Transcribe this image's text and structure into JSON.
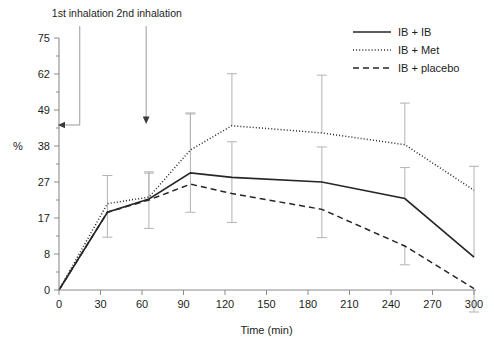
{
  "chart_data": {
    "type": "line",
    "title": "",
    "xlabel": "Time (min)",
    "ylabel": "%",
    "xlim": [
      0,
      300
    ],
    "ylim": [
      0,
      75
    ],
    "grid": false,
    "legend_position": "top-right",
    "x_ticks": [
      0,
      30,
      60,
      90,
      120,
      150,
      180,
      210,
      240,
      270,
      300
    ],
    "x_tick_labels": [
      "0",
      "30",
      "60",
      "90",
      "120",
      "150",
      "180",
      "210",
      "240",
      "270",
      "300"
    ],
    "y_ticks": [
      0,
      8,
      17,
      27,
      38,
      49,
      62,
      75
    ],
    "y_tick_labels": [
      "0",
      "8",
      "17",
      "27",
      "38",
      "49",
      "62",
      "75"
    ],
    "x": [
      0,
      35,
      65,
      95,
      125,
      190,
      250,
      300
    ],
    "series": [
      {
        "name": "IB + IB",
        "style": "solid",
        "values": [
          0,
          18.6,
          22.3,
          29.8,
          28.4,
          27.0,
          22.4,
          7.3
        ],
        "error_upper": [
          null,
          29.0,
          29.7,
          47.8,
          39.3,
          37.7,
          31.4,
          31.8
        ],
        "error_lower": [
          null,
          12.2,
          14.4,
          18.6,
          15.9,
          12.1,
          null,
          null
        ]
      },
      {
        "name": "IB + Met",
        "style": "dotted",
        "values": [
          0,
          21.0,
          22.8,
          36.8,
          44.2,
          42.0,
          38.4,
          24.7
        ],
        "error_upper": [
          null,
          null,
          30.1,
          48.1,
          62.1,
          61.6,
          51.5,
          null
        ],
        "error_lower": [
          null,
          null,
          null,
          null,
          null,
          null,
          null,
          null
        ]
      },
      {
        "name": "IB + placebo",
        "style": "dashed",
        "values": [
          0,
          18.6,
          22.0,
          26.4,
          23.8,
          19.4,
          10.0,
          0.3
        ],
        "error_upper": [
          null,
          null,
          null,
          null,
          null,
          null,
          null,
          null
        ],
        "error_lower": [
          null,
          null,
          null,
          null,
          null,
          null,
          5.6,
          null
        ]
      }
    ],
    "annotations": [
      {
        "label": "1st inhalation",
        "x": 15
      },
      {
        "label": "2nd inhalation",
        "x": 63
      }
    ]
  },
  "legend": {
    "entries": [
      {
        "label": "IB + IB"
      },
      {
        "label": "IB + Met"
      },
      {
        "label": "IB + placebo"
      }
    ]
  }
}
